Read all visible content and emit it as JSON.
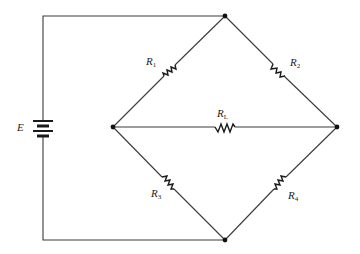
{
  "diagram": {
    "type": "circuit",
    "source": {
      "label": "E",
      "symbol": "battery"
    },
    "resistors": [
      {
        "id": "R1",
        "main": "R",
        "sub": "1",
        "branch": "top-left"
      },
      {
        "id": "R2",
        "main": "R",
        "sub": "2",
        "branch": "top-right"
      },
      {
        "id": "RL",
        "main": "R",
        "sub": "L",
        "branch": "middle"
      },
      {
        "id": "R3",
        "main": "R",
        "sub": "3",
        "branch": "bottom-left"
      },
      {
        "id": "R4",
        "main": "R",
        "sub": "4",
        "branch": "bottom-right"
      }
    ],
    "nodes": [
      "top",
      "left",
      "right",
      "bottom"
    ],
    "colors": {
      "wire": "#3a3a3a",
      "component": "#1a1a1a",
      "background": "#ffffff"
    }
  }
}
